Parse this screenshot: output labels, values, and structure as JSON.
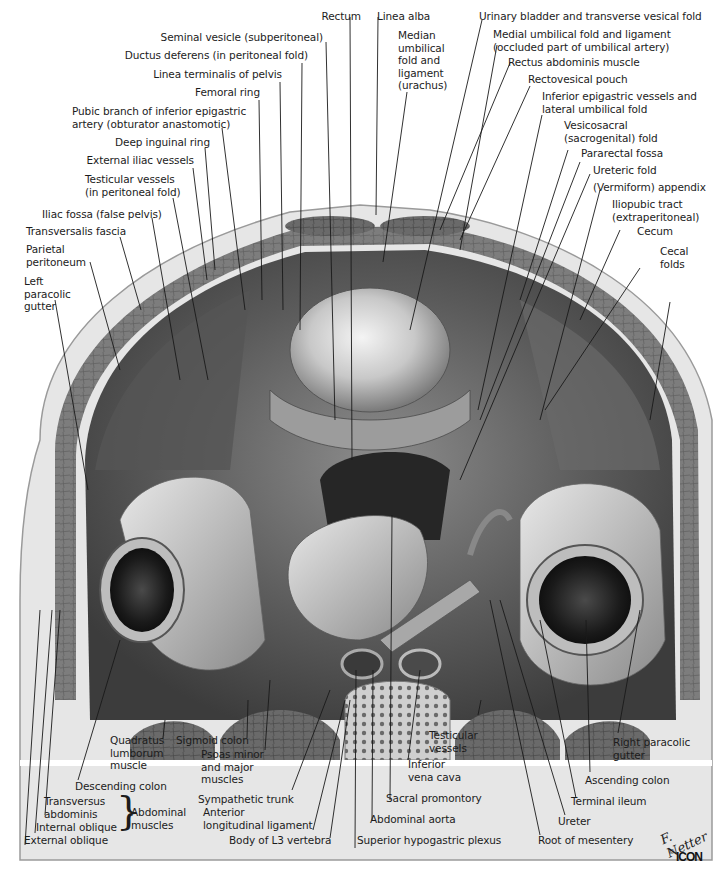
{
  "figure": {
    "palette": {
      "background": "#ffffff",
      "text": "#1c1c1c",
      "leader": "#1a1a1a",
      "tissue_light": "#d9d9d9",
      "tissue_mid": "#9a9a9a",
      "tissue_dark": "#3a3a3a",
      "muscle": "#6e6e6e"
    }
  },
  "labels_top": [
    {
      "id": "rectum",
      "text": "Rectum"
    },
    {
      "id": "seminal-vesicle",
      "text": "Seminal vesicle (subperitoneal)"
    },
    {
      "id": "ductus-deferens",
      "text": "Ductus deferens (in peritoneal fold)"
    },
    {
      "id": "linea-terminalis",
      "text": "Linea terminalis of pelvis"
    },
    {
      "id": "femoral-ring",
      "text": "Femoral ring"
    },
    {
      "id": "pubic-branch",
      "text": "Pubic branch of inferior epigastric\nartery (obturator anastomotic)"
    },
    {
      "id": "deep-inguinal-ring",
      "text": "Deep inguinal ring"
    },
    {
      "id": "external-iliac",
      "text": "External iliac vessels"
    },
    {
      "id": "testicular-vessels-fold",
      "text": "Testicular vessels\n(in peritoneal fold)"
    },
    {
      "id": "iliac-fossa",
      "text": "Iliac fossa (false pelvis)"
    },
    {
      "id": "transversalis-fascia",
      "text": "Transversalis fascia"
    },
    {
      "id": "parietal-peritoneum",
      "text": "Parietal\nperitoneum"
    },
    {
      "id": "left-paracolic",
      "text": "Left\nparacolic\ngutter"
    },
    {
      "id": "linea-alba",
      "text": "Linea alba"
    },
    {
      "id": "median-umbilical",
      "text": "Median\numbilical\nfold and\nligament\n(urachus)"
    },
    {
      "id": "urinary-bladder",
      "text": "Urinary bladder and transverse vesical fold"
    },
    {
      "id": "medial-umbilical",
      "text": "Medial umbilical fold and ligament\n(occluded part of umbilical artery)"
    },
    {
      "id": "rectus-abdominis",
      "text": "Rectus abdominis muscle"
    },
    {
      "id": "rectovesical-pouch",
      "text": "Rectovesical pouch"
    },
    {
      "id": "inferior-epigastric",
      "text": "Inferior epigastric vessels and\nlateral umbilical fold"
    },
    {
      "id": "vesicosacral",
      "text": "Vesicosacral\n(sacrogenital) fold"
    },
    {
      "id": "pararectal-fossa",
      "text": "Pararectal fossa"
    },
    {
      "id": "ureteric-fold",
      "text": "Ureteric fold"
    },
    {
      "id": "appendix",
      "text": "(Vermiform) appendix"
    },
    {
      "id": "iliopubic-tract",
      "text": "Iliopubic tract\n(extraperitoneal)"
    },
    {
      "id": "cecum",
      "text": "Cecum"
    },
    {
      "id": "cecal-folds",
      "text": "Cecal\nfolds"
    }
  ],
  "labels_bottom": [
    {
      "id": "quadratus-lumborum",
      "text": "Quadratus\nlumborum\nmuscle"
    },
    {
      "id": "sigmoid-colon",
      "text": "Sigmoid colon"
    },
    {
      "id": "psoas",
      "text": "Psoas minor\nand major\nmuscles"
    },
    {
      "id": "descending-colon",
      "text": "Descending colon"
    },
    {
      "id": "sympathetic-trunk",
      "text": "Sympathetic trunk"
    },
    {
      "id": "transversus-abdominis",
      "text": "Transversus\nabdominis"
    },
    {
      "id": "internal-oblique",
      "text": "Internal oblique"
    },
    {
      "id": "external-oblique",
      "text": "External oblique"
    },
    {
      "id": "abdominal-muscles",
      "text": "Abdominal\nmuscles"
    },
    {
      "id": "anterior-longitudinal",
      "text": "Anterior\nlongitudinal ligament"
    },
    {
      "id": "body-l3",
      "text": "Body of L3 vertebra"
    },
    {
      "id": "superior-hypogastric",
      "text": "Superior hypogastric plexus"
    },
    {
      "id": "abdominal-aorta",
      "text": "Abdominal aorta"
    },
    {
      "id": "sacral-promontory",
      "text": "Sacral promontory"
    },
    {
      "id": "inferior-vena-cava",
      "text": "Inferior\nvena cava"
    },
    {
      "id": "testicular-vessels",
      "text": "Testicular\nvessels"
    },
    {
      "id": "root-mesentery",
      "text": "Root of mesentery"
    },
    {
      "id": "ureter",
      "text": "Ureter"
    },
    {
      "id": "terminal-ileum",
      "text": "Terminal ileum"
    },
    {
      "id": "ascending-colon",
      "text": "Ascending colon"
    },
    {
      "id": "right-paracolic",
      "text": "Right paracolic\ngutter"
    }
  ],
  "signature": {
    "artist": "F. Netter",
    "copyright": "©",
    "publisher": "ICON"
  }
}
